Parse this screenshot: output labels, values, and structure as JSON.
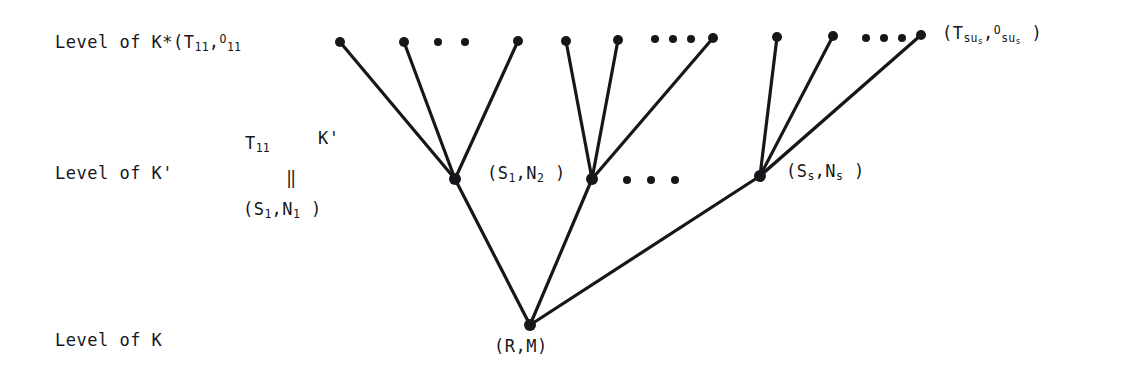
{
  "figure": {
    "background": "#ffffff",
    "ink_color": "#17171b",
    "levels": [
      {
        "id": "level-kstar",
        "label_prefix": "Level of K*(",
        "base1": "T",
        "sub1": "11",
        "comma": ",",
        "base2": "O",
        "sub2": "11",
        "y": 44
      },
      {
        "id": "level-kprime",
        "label": "Level of K'",
        "y": 175
      },
      {
        "id": "level-k",
        "label": "Level of K",
        "y": 325
      }
    ],
    "left_labels": [
      {
        "name": "level-kstar-label",
        "text": "Level of K*(T11,O11",
        "x": 55,
        "y": 34
      },
      {
        "name": "level-kprime-label",
        "text": "Level of K'",
        "x": 55,
        "y": 165
      },
      {
        "name": "level-k-label",
        "text": "Level of K",
        "x": 55,
        "y": 332
      }
    ],
    "node_labels": [
      {
        "name": "top-right-leaf-label",
        "text": "(Tsus,Osus)",
        "x": 942,
        "y": 24
      },
      {
        "name": "kprime-node-1-identity-top",
        "text": "T11",
        "x": 245,
        "y": 135
      },
      {
        "name": "kprime-node-1-identity-kprime",
        "text": "K'",
        "x": 317,
        "y": 130
      },
      {
        "name": "kprime-node-1-identity-eq",
        "text": "‖",
        "x": 285,
        "y": 172
      },
      {
        "name": "kprime-node-1-label",
        "text": "(S1,N1)",
        "x": 243,
        "y": 200
      },
      {
        "name": "kprime-node-2-label",
        "text": "(S1,N2)",
        "x": 487,
        "y": 164
      },
      {
        "name": "kprime-node-s-label",
        "text": "(Ss,Ns)",
        "x": 786,
        "y": 163
      },
      {
        "name": "root-node-label",
        "text": "(R,M)",
        "x": 494,
        "y": 338
      }
    ],
    "ellipses": [
      {
        "name": "top-ellipsis-1",
        "dots": 2,
        "x": 438,
        "y": 42
      },
      {
        "name": "top-ellipsis-2",
        "dots": 3,
        "x": 655,
        "y": 39
      },
      {
        "name": "top-ellipsis-3",
        "dots": 3,
        "x": 866,
        "y": 38
      },
      {
        "name": "middle-ellipsis",
        "dots": 3,
        "x": 627,
        "y": 180
      }
    ],
    "nodes": {
      "root": {
        "name": "root-node",
        "x": 530,
        "y": 325,
        "r": 6
      },
      "kprime": [
        {
          "name": "kprime-node-1",
          "x": 455,
          "y": 179,
          "r": 6
        },
        {
          "name": "kprime-node-2",
          "x": 592,
          "y": 179,
          "r": 6
        },
        {
          "name": "kprime-node-s",
          "x": 760,
          "y": 176,
          "r": 6
        }
      ],
      "kstar": [
        {
          "name": "kstar-leaf-1",
          "x": 340,
          "y": 42,
          "r": 5
        },
        {
          "name": "kstar-leaf-2",
          "x": 404,
          "y": 42,
          "r": 5
        },
        {
          "name": "kstar-leaf-3",
          "x": 518,
          "y": 41,
          "r": 5
        },
        {
          "name": "kstar-leaf-4",
          "x": 566,
          "y": 41,
          "r": 5
        },
        {
          "name": "kstar-leaf-5",
          "x": 618,
          "y": 40,
          "r": 5
        },
        {
          "name": "kstar-leaf-6",
          "x": 713,
          "y": 38,
          "r": 5
        },
        {
          "name": "kstar-leaf-7",
          "x": 777,
          "y": 37,
          "r": 5
        },
        {
          "name": "kstar-leaf-8",
          "x": 833,
          "y": 36,
          "r": 5
        },
        {
          "name": "kstar-leaf-9",
          "x": 921,
          "y": 35,
          "r": 5
        }
      ]
    },
    "edges": [
      {
        "name": "edge-root-to-kprime-1",
        "from": [
          530,
          325
        ],
        "to": [
          455,
          179
        ]
      },
      {
        "name": "edge-root-to-kprime-2",
        "from": [
          530,
          325
        ],
        "to": [
          592,
          179
        ]
      },
      {
        "name": "edge-root-to-kprime-s",
        "from": [
          530,
          325
        ],
        "to": [
          760,
          176
        ]
      },
      {
        "name": "edge-kprime1-to-leaf-1",
        "from": [
          455,
          179
        ],
        "to": [
          340,
          42
        ]
      },
      {
        "name": "edge-kprime1-to-leaf-2",
        "from": [
          455,
          179
        ],
        "to": [
          404,
          42
        ]
      },
      {
        "name": "edge-kprime1-to-leaf-3",
        "from": [
          455,
          179
        ],
        "to": [
          518,
          41
        ]
      },
      {
        "name": "edge-kprime2-to-leaf-4",
        "from": [
          592,
          179
        ],
        "to": [
          566,
          41
        ]
      },
      {
        "name": "edge-kprime2-to-leaf-5",
        "from": [
          592,
          179
        ],
        "to": [
          618,
          40
        ]
      },
      {
        "name": "edge-kprime2-to-leaf-6",
        "from": [
          592,
          179
        ],
        "to": [
          713,
          38
        ]
      },
      {
        "name": "edge-kprimes-to-leaf-7",
        "from": [
          760,
          176
        ],
        "to": [
          777,
          37
        ]
      },
      {
        "name": "edge-kprimes-to-leaf-8",
        "from": [
          760,
          176
        ],
        "to": [
          833,
          36
        ]
      },
      {
        "name": "edge-kprimes-to-leaf-9",
        "from": [
          760,
          176
        ],
        "to": [
          921,
          35
        ]
      }
    ]
  }
}
